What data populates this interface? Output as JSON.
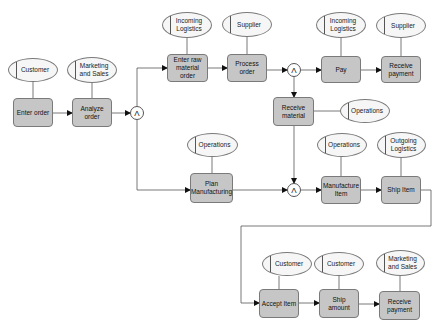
{
  "diagram": {
    "type": "event-driven process chain",
    "colors": {
      "function_fill": "#c6c6c6",
      "role_fill": "#f6f6f6",
      "stroke": "#7a7a7a"
    },
    "gate_symbol": "Λ",
    "functions": [
      {
        "id": "enter_order",
        "label": "Enter order"
      },
      {
        "id": "analyze_order",
        "label": "Analyze order"
      },
      {
        "id": "enter_raw",
        "label": "Enter raw material order"
      },
      {
        "id": "process_order",
        "label": "Process order"
      },
      {
        "id": "pay",
        "label": "Pay"
      },
      {
        "id": "receive_payment_1",
        "label": "Receive payment"
      },
      {
        "id": "receive_material",
        "label": "Receive material"
      },
      {
        "id": "plan_manufacturing",
        "label": "Plan Manufacturing"
      },
      {
        "id": "manufacture_item",
        "label": "Manufacture Item"
      },
      {
        "id": "ship_item",
        "label": "Ship Item"
      },
      {
        "id": "accept_item",
        "label": "Accept Item"
      },
      {
        "id": "ship_amount",
        "label": "Ship amount"
      },
      {
        "id": "receive_payment_2",
        "label": "Receive payment"
      }
    ],
    "roles": [
      {
        "label": "Customer"
      },
      {
        "label": "Marketing and Sales"
      },
      {
        "label": "Incoming Logistics"
      },
      {
        "label": "Supplier"
      },
      {
        "label": "Incoming Logistics"
      },
      {
        "label": "Supplier"
      },
      {
        "label": "Operations"
      },
      {
        "label": "Operations"
      },
      {
        "label": "Operations"
      },
      {
        "label": "Outgoing Logistics"
      },
      {
        "label": "Customer"
      },
      {
        "label": "Customer"
      },
      {
        "label": "Marketing and Sales"
      }
    ],
    "gates": [
      {
        "label": "Λ"
      },
      {
        "label": "Λ"
      },
      {
        "label": "Λ"
      }
    ]
  }
}
